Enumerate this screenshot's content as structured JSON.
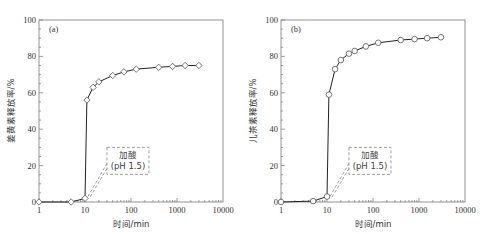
{
  "chart_data": [
    {
      "type": "line",
      "panel_label": "(a)",
      "title": "",
      "xlabel": "时间/min",
      "ylabel": "姜黄素释放率/%",
      "xscale": "log",
      "xlim": [
        1,
        10000
      ],
      "ylim": [
        0,
        100
      ],
      "xticks": [
        1,
        10,
        100,
        1000,
        10000
      ],
      "xtick_labels": [
        "1",
        "10",
        "100",
        "1000",
        "10000"
      ],
      "yticks": [
        0,
        20,
        40,
        60,
        80,
        100
      ],
      "ytick_labels": [
        "0",
        "20",
        "40",
        "60",
        "80",
        "100"
      ],
      "grid": false,
      "marker": "diamond",
      "series": [
        {
          "name": "姜黄素",
          "x": [
            1,
            5,
            10,
            11,
            15,
            20,
            40,
            70,
            130,
            400,
            800,
            1500,
            3000
          ],
          "y": [
            0,
            0,
            2,
            56,
            63,
            66,
            69.5,
            71.5,
            73,
            74,
            74.5,
            75,
            75
          ]
        }
      ],
      "annotation": {
        "line1": "加酸",
        "line2": "(pH 1.5)",
        "points_to_x": 10
      }
    },
    {
      "type": "line",
      "panel_label": "(b)",
      "title": "",
      "xlabel": "时间/min",
      "ylabel": "儿茶素释放率/%",
      "xscale": "log",
      "xlim": [
        1,
        10000
      ],
      "ylim": [
        0,
        100
      ],
      "xticks": [
        1,
        10,
        100,
        1000,
        10000
      ],
      "xtick_labels": [
        "1",
        "10",
        "100",
        "1000",
        "10000"
      ],
      "yticks": [
        0,
        20,
        40,
        60,
        80,
        100
      ],
      "ytick_labels": [
        "0",
        "20",
        "40",
        "60",
        "80",
        "100"
      ],
      "grid": false,
      "marker": "circle",
      "series": [
        {
          "name": "儿茶素",
          "x": [
            1,
            5,
            10,
            11,
            15,
            20,
            30,
            40,
            70,
            130,
            400,
            800,
            1500,
            3000
          ],
          "y": [
            0,
            0.5,
            3,
            59,
            73,
            78,
            81.5,
            83,
            85.5,
            87.5,
            89,
            89.5,
            90,
            90.5
          ]
        }
      ],
      "annotation": {
        "line1": "加酸",
        "line2": "(pH 1.5)",
        "points_to_x": 10
      }
    }
  ]
}
